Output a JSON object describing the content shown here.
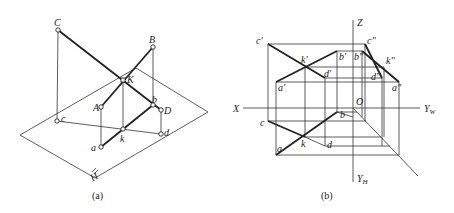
{
  "figure_a": {
    "caption": "(a)",
    "plane_label": "H",
    "points": {
      "C": "C",
      "B": "B",
      "K": "K",
      "A": "A",
      "D": "D",
      "c": "c",
      "b": "b",
      "k": "k",
      "d": "d",
      "a": "a"
    }
  },
  "figure_b": {
    "caption": "(b)",
    "axes": {
      "Z": "Z",
      "X": "X",
      "O": "O",
      "YW": "Y",
      "YW_sub": "W",
      "YH": "Y",
      "YH_sub": "H"
    },
    "front_view": {
      "c1": "c'",
      "k1": "k'",
      "b1": "b'",
      "d1": "d'",
      "a1": "a'"
    },
    "side_view": {
      "c2": "c\"",
      "b2": "b\"",
      "k2": "k\"",
      "d2": "d\"",
      "a2": "a\""
    },
    "top_view": {
      "c": "c",
      "k": "k",
      "b": "b",
      "d": "d",
      "a": "a"
    }
  }
}
